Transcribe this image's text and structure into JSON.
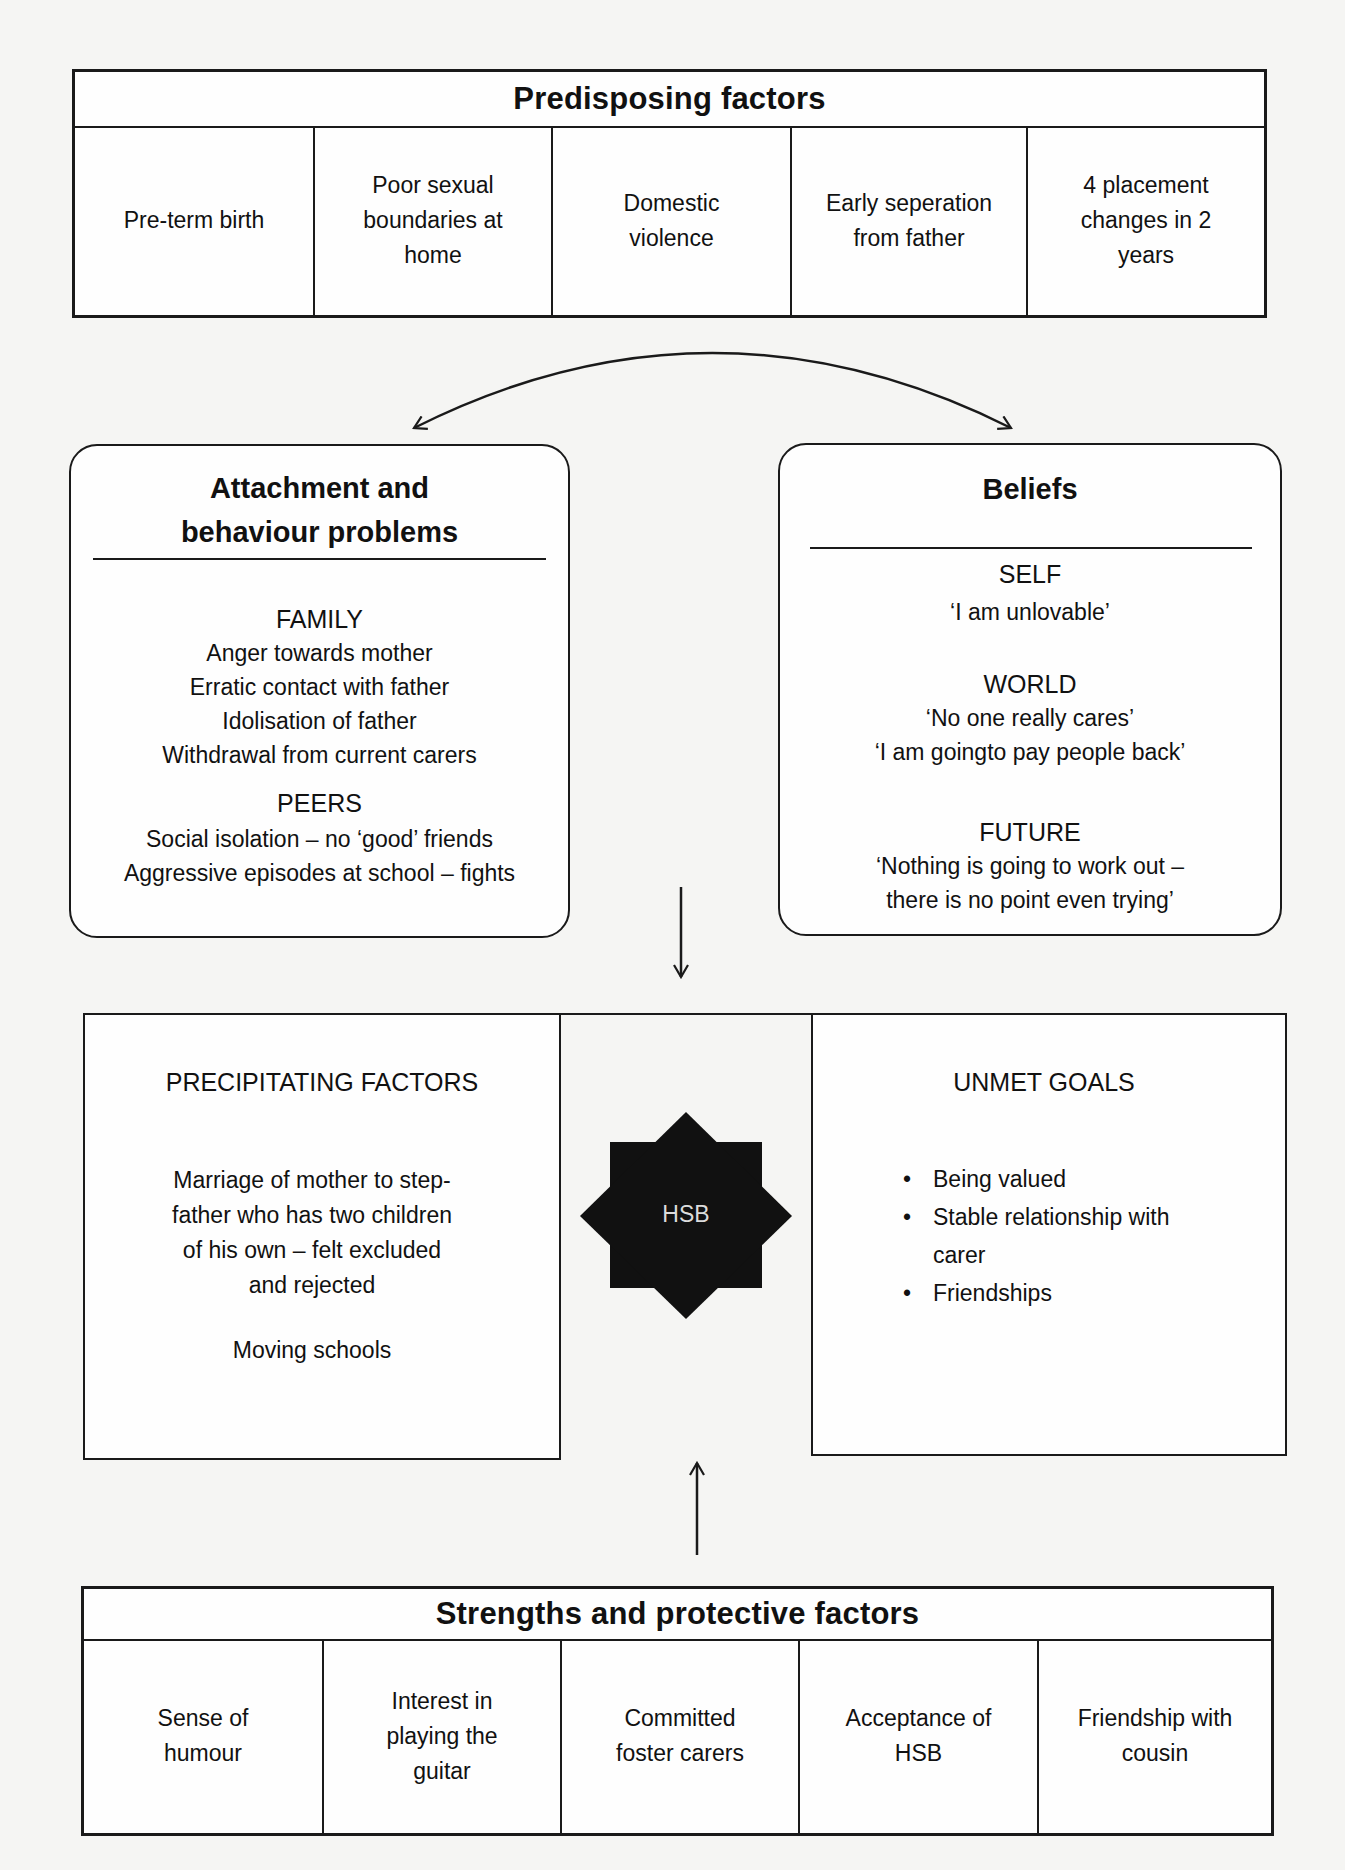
{
  "predisposing": {
    "title": "Predisposing factors",
    "items": [
      "Pre-term birth",
      "Poor sexual\nboundaries at\nhome",
      "Domestic\nviolence",
      "Early seperation\nfrom father",
      "4 placement\nchanges in 2\nyears"
    ]
  },
  "attachment": {
    "title": "Attachment and\nbehaviour problems",
    "family": {
      "heading": "FAMILY",
      "items": [
        "Anger towards mother",
        "Erratic contact with father",
        "Idolisation of father",
        "Withdrawal from current carers"
      ]
    },
    "peers": {
      "heading": "PEERS",
      "items": [
        "Social isolation – no ‘good’ friends",
        "Aggressive episodes at school – fights"
      ]
    }
  },
  "beliefs": {
    "title": "Beliefs",
    "self": {
      "heading": "SELF",
      "items": [
        "‘I am unlovable’"
      ]
    },
    "world": {
      "heading": "WORLD",
      "items": [
        "‘No one really cares’",
        "‘I am goingto pay people back’"
      ]
    },
    "future": {
      "heading": "FUTURE",
      "items": [
        "‘Nothing is going to work out –",
        "there is no point even trying’"
      ]
    }
  },
  "precipitating": {
    "title": "PRECIPITATING FACTORS",
    "items": [
      "Marriage of mother to step-\nfather who has two children\nof his own – felt excluded\nand rejected",
      "Moving schools"
    ]
  },
  "center": {
    "label": "HSB",
    "shape": "eight-point-star",
    "fill": "#111111",
    "text_color": "#dddddd"
  },
  "unmet_goals": {
    "title": "UNMET GOALS",
    "items": [
      "Being valued",
      "Stable relationship with\ncarer",
      "Friendships"
    ]
  },
  "strengths": {
    "title": "Strengths and protective factors",
    "items": [
      "Sense of\nhumour",
      "Interest in\nplaying the\nguitar",
      "Committed\nfoster carers",
      "Acceptance of\nHSB",
      "Friendship with\ncousin"
    ]
  },
  "connectors": [
    {
      "type": "double-curved-arrow",
      "from": "attachment",
      "to": "beliefs"
    },
    {
      "type": "down-arrow",
      "from": "attachment-beliefs",
      "to": "center"
    },
    {
      "type": "up-arrow",
      "from": "strengths",
      "to": "center"
    }
  ]
}
